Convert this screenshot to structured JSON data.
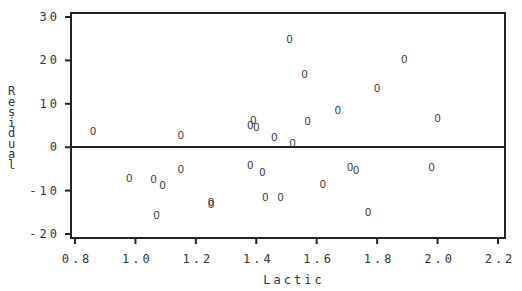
{
  "chart_data": {
    "type": "scatter",
    "title": "",
    "xlabel": "Lactic",
    "ylabel": "Residual",
    "xlim": [
      0.8,
      2.2
    ],
    "ylim": [
      -20,
      30
    ],
    "xticks": [
      "0.8",
      "1.0",
      "1.2",
      "1.4",
      "1.6",
      "1.8",
      "2.0",
      "2.2"
    ],
    "yticks": [
      "-20",
      "-10",
      "0",
      "10",
      "20",
      "30"
    ],
    "reference_line": {
      "y": 0
    },
    "marker": "0",
    "grid": false,
    "legend": null,
    "points": [
      {
        "x": 0.86,
        "y": 3.7
      },
      {
        "x": 0.98,
        "y": -7.1
      },
      {
        "x": 1.06,
        "y": -7.4
      },
      {
        "x": 1.07,
        "y": -15.7
      },
      {
        "x": 1.09,
        "y": -8.8
      },
      {
        "x": 1.15,
        "y": -5.1
      },
      {
        "x": 1.15,
        "y": 2.8
      },
      {
        "x": 1.25,
        "y": -12.7
      },
      {
        "x": 1.25,
        "y": -13.0
      },
      {
        "x": 1.38,
        "y": -4.1
      },
      {
        "x": 1.38,
        "y": 5.1
      },
      {
        "x": 1.39,
        "y": 6.2
      },
      {
        "x": 1.4,
        "y": 4.6
      },
      {
        "x": 1.42,
        "y": -5.8
      },
      {
        "x": 1.46,
        "y": 2.3
      },
      {
        "x": 1.43,
        "y": -11.5
      },
      {
        "x": 1.48,
        "y": -11.5
      },
      {
        "x": 1.52,
        "y": 0.9
      },
      {
        "x": 1.51,
        "y": 24.9
      },
      {
        "x": 1.56,
        "y": 16.8
      },
      {
        "x": 1.57,
        "y": 6.0
      },
      {
        "x": 1.62,
        "y": -8.5
      },
      {
        "x": 1.67,
        "y": 8.5
      },
      {
        "x": 1.71,
        "y": -4.6
      },
      {
        "x": 1.73,
        "y": -5.3
      },
      {
        "x": 1.77,
        "y": -15.0
      },
      {
        "x": 1.8,
        "y": 13.6
      },
      {
        "x": 1.89,
        "y": 20.3
      },
      {
        "x": 1.98,
        "y": -4.6
      },
      {
        "x": 2.0,
        "y": 6.7
      }
    ]
  },
  "axes": {
    "x_label": "Lactic",
    "y_label": "Residual"
  }
}
